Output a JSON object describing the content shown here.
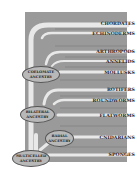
{
  "diagram": {
    "type": "phylogenetic-tree",
    "colors": {
      "panel": "#9a9a9a",
      "branch": "#e6e6e6",
      "branch_outline": "#c8c8c8",
      "node_fill": "#b8b8b8",
      "label_text": "#1e1e1e"
    },
    "taxa": [
      {
        "label": "CHORDATES"
      },
      {
        "label": "ECHINODERMS"
      },
      {
        "label": "ARTHROPODS"
      },
      {
        "label": "ANNELIDS"
      },
      {
        "label": "MOLLUSKS"
      },
      {
        "label": "ROTIFERS"
      },
      {
        "label": "ROUNDWORMS"
      },
      {
        "label": "FLATWORMS"
      },
      {
        "label": "CNIDARIANS"
      },
      {
        "label": "SPONGES"
      }
    ],
    "nodes": {
      "coelomate": {
        "line1": "COELOMATE",
        "line2": "ANCESTRY"
      },
      "bilateral": {
        "line1": "BILATERAL",
        "line2": "ANCESTRY"
      },
      "radial": {
        "line1": "RADIAL",
        "line2": "ANCESTRY"
      },
      "multicelled": {
        "line1": "MULTICELLED",
        "line2": "ANCESTRY"
      }
    }
  }
}
